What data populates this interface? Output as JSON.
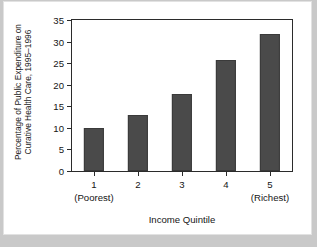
{
  "figure": {
    "background": "#ffffff",
    "page_background": "#c9c9c9",
    "frame_color": "#2b2b2b"
  },
  "chart_data": {
    "type": "bar",
    "title": "",
    "categories": [
      "1",
      "2",
      "3",
      "4",
      "5"
    ],
    "category_sublabels": [
      "(Poorest)",
      "",
      "",
      "",
      "(Richest)"
    ],
    "values": [
      10.0,
      12.9,
      17.8,
      25.7,
      31.7
    ],
    "series": [
      {
        "name": "Percentage of Public Expenditure on Curative Health Care, 1995-1996",
        "values": [
          10.0,
          12.9,
          17.8,
          25.7,
          31.7
        ]
      }
    ],
    "xlabel": "Income Quintile",
    "ylabel_line1": "Percentage of Public Expenditure on",
    "ylabel_line2": "Curative Health Care, 1995–1996",
    "ylim": [
      0,
      35
    ],
    "yticks": [
      0,
      5,
      10,
      15,
      20,
      25,
      30,
      35
    ],
    "ytick_labels": [
      "0",
      "5",
      "10",
      "15",
      "20",
      "25",
      "30",
      "35"
    ],
    "grid": false,
    "legend": false,
    "bar_color": "#4a4a4a",
    "bar_edge_color": "#3a3a3a"
  }
}
